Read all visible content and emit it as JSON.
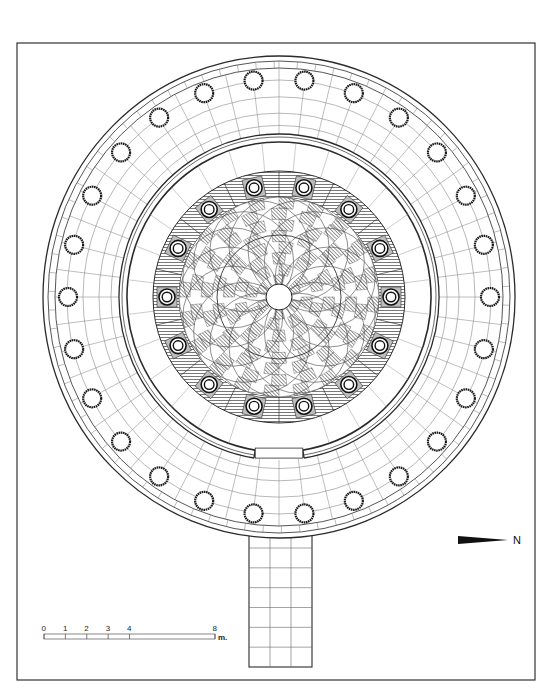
{
  "drawing": {
    "type": "architectural floor plan",
    "subject": "circular columned building with central checkered floor and entrance corridor",
    "frame": {
      "x": 17,
      "y": 43,
      "width": 518,
      "height": 637
    },
    "center": {
      "x": 279,
      "y": 297
    },
    "colors": {
      "ink": "#2a2a2a",
      "hatch": "#8a8a8a",
      "paper": "#ffffff",
      "check_dark": "#9a9a9a"
    }
  },
  "outer_ring": {
    "rx": 236,
    "ry": 241,
    "wall_offsets": [
      0,
      5,
      12
    ],
    "column_count": 26,
    "column_radius_x": 211,
    "column_radius_y": 218,
    "column_size": 9
  },
  "inner_wall": {
    "rx": 160,
    "ry": 163,
    "thickness": 8,
    "opening_half_angle_deg": 9
  },
  "hatched_ring": {
    "outer_r": 126,
    "inner_r": 100,
    "column_count": 14,
    "column_radius": 112,
    "column_size": 8
  },
  "central_floor": {
    "radius": 100,
    "pattern": "interlaced checkerboard rosette",
    "center_opening_radius": 13
  },
  "corridor": {
    "x": 249,
    "width": 63,
    "top": 520,
    "bottom": 667,
    "columns": 3,
    "rows": 6
  },
  "north_arrow": {
    "label": "N",
    "x": 458,
    "y": 540
  },
  "scale_bar": {
    "ticks": [
      "0",
      "1",
      "2",
      "3",
      "4",
      "8"
    ],
    "unit": "m.",
    "x0": 44,
    "x_end": 215,
    "y": 634
  }
}
